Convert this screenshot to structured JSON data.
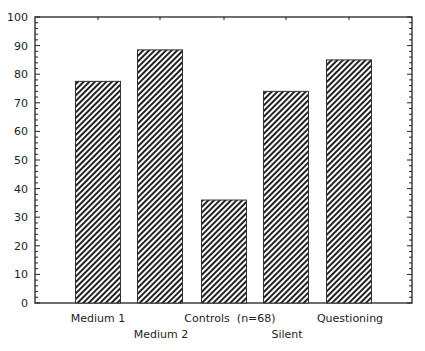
{
  "chart_data": {
    "type": "bar",
    "title": "",
    "xlabel": "",
    "ylabel": "",
    "categories": [
      "Medium 1",
      "Medium 2",
      "Controls (n=68)",
      "Silent",
      "Questioning"
    ],
    "values": [
      77.5,
      88.5,
      36,
      74,
      85
    ],
    "ylim": [
      0,
      100
    ],
    "yticks": [
      0,
      10,
      20,
      30,
      40,
      50,
      60,
      70,
      80,
      90,
      100
    ],
    "grid": false,
    "legend": null,
    "bar_fill": "diagonal-hatch",
    "colors": {
      "bar_stroke": "#333333",
      "hatch": "#222222",
      "axis": "#222222"
    }
  },
  "labels": {
    "cat0": "Medium 1",
    "cat1": "Medium 2",
    "cat2": "Controls  (n=68)",
    "cat3": "Silent",
    "cat4": "Questioning"
  }
}
